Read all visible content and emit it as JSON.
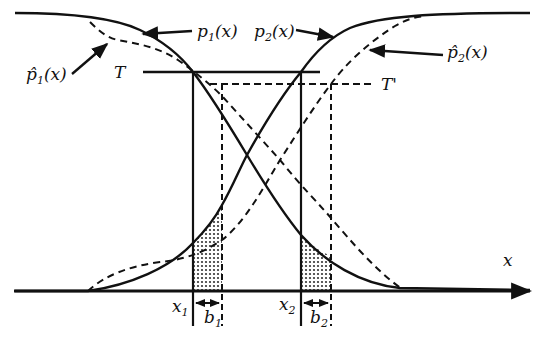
{
  "diagram": {
    "type": "threshold-shift-illustration",
    "axis": {
      "label": "x"
    },
    "curves": [
      {
        "id": "p1",
        "label": "p",
        "subscript": "1",
        "arg": "(x)",
        "style": "solid",
        "shape": "decreasing sigmoid"
      },
      {
        "id": "p2",
        "label": "p",
        "subscript": "2",
        "arg": "(x)",
        "style": "solid",
        "shape": "increasing sigmoid"
      },
      {
        "id": "p1hat",
        "label": "p̂",
        "subscript": "1",
        "arg": "(x)",
        "style": "dashed",
        "shape": "decreasing sigmoid (shifted right)"
      },
      {
        "id": "p2hat",
        "label": "p̂",
        "subscript": "2",
        "arg": "(x)",
        "style": "dashed",
        "shape": "increasing sigmoid (shifted right)"
      }
    ],
    "thresholds": [
      {
        "id": "T",
        "label": "T",
        "style": "solid"
      },
      {
        "id": "T_prime",
        "label": "T'",
        "style": "dashed"
      }
    ],
    "markers": [
      {
        "id": "x1",
        "label": "x",
        "subscript": "1"
      },
      {
        "id": "x2",
        "label": "x",
        "subscript": "2"
      }
    ],
    "shifts": [
      {
        "id": "b1",
        "label": "b",
        "subscript": "1"
      },
      {
        "id": "b2",
        "label": "b",
        "subscript": "2"
      }
    ],
    "colors": {
      "ink": "#111111",
      "background": "#ffffff",
      "shading": "#555555"
    }
  }
}
